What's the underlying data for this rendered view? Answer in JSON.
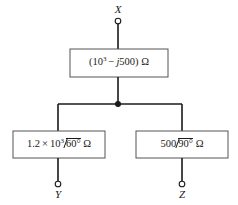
{
  "figure": {
    "name": "impedance-network-diagram",
    "background_color": "#ffffff",
    "line_color": "#1a1a1a"
  },
  "terminals": [
    {
      "id": "x",
      "label": "X",
      "position": "top"
    },
    {
      "id": "y",
      "label": "Y",
      "position": "bottom-left"
    },
    {
      "id": "z",
      "label": "Z",
      "position": "bottom-right"
    }
  ],
  "components": {
    "series": {
      "id": "series-impedance",
      "open_paren": "(",
      "base": "10",
      "exponent": "3",
      "sign": "−",
      "imaginary": "j",
      "reactance": "500",
      "close_paren": ")",
      "unit": "Ω",
      "full_text": "(10³ − j500) Ω"
    },
    "branch_left": {
      "id": "left-branch-impedance",
      "coefficient": "1.2",
      "times": "×",
      "base": "10",
      "exponent": "3",
      "angle": "60",
      "degree": "°",
      "unit": "Ω",
      "full_text": "1.2 × 10³∠60° Ω"
    },
    "branch_right": {
      "id": "right-branch-impedance",
      "magnitude": "500",
      "angle": "90",
      "degree": "°",
      "unit": "Ω",
      "full_text": "500∠90° Ω"
    }
  },
  "junction": {
    "name": "node-junction-dot",
    "visible": true
  }
}
